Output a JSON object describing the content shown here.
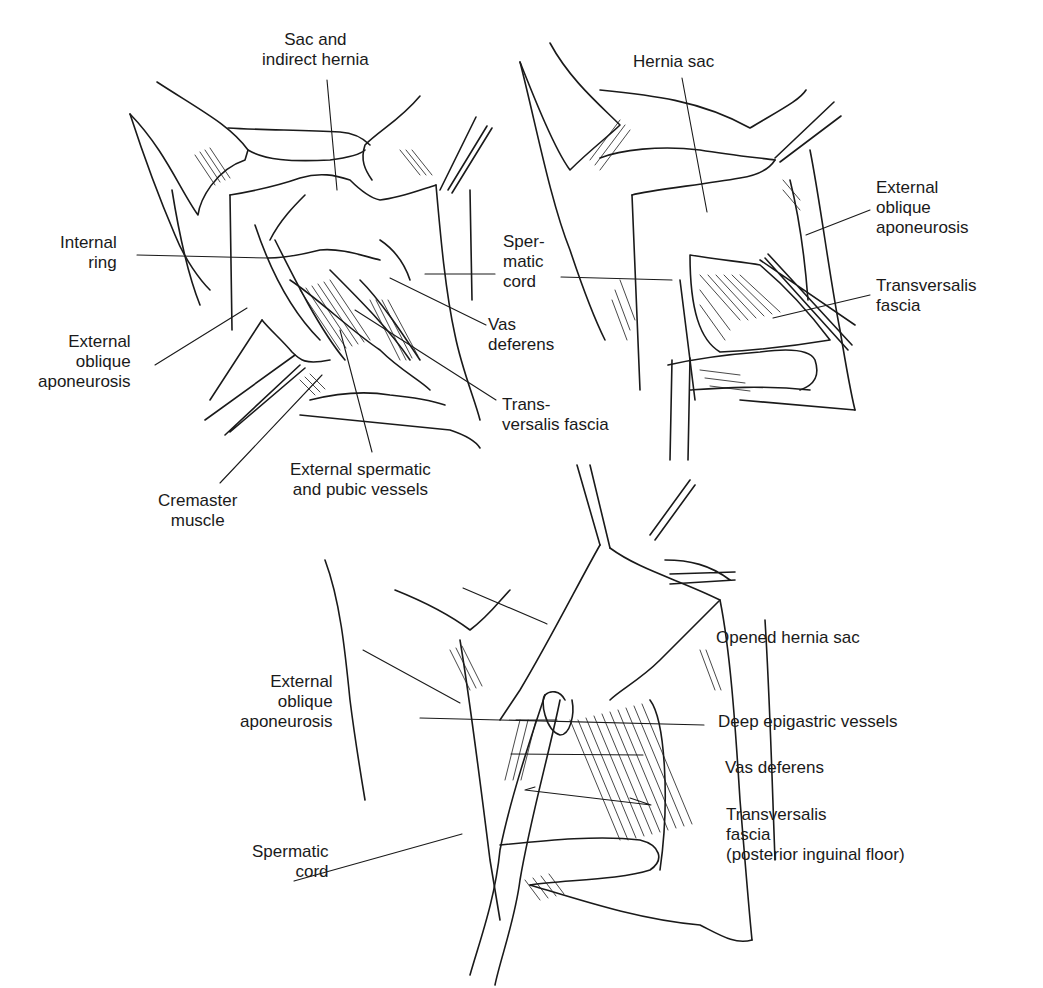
{
  "figure": {
    "panels": [
      {
        "id": "top-left",
        "labels": {
          "sac": "Sac and\nindirect hernia",
          "internal_ring": "Internal\nring",
          "ext_oblique": "External\noblique\naponeurosis",
          "cremaster": "Cremaster\nmuscle",
          "ext_spermatic": "External spermatic\nand pubic vessels",
          "vas": "Vas\ndeferens",
          "transversalis": "Trans-\nversalis fascia",
          "spermatic_cord": "Sper-\nmatic\ncord"
        }
      },
      {
        "id": "top-right",
        "labels": {
          "hernia_sac": "Hernia sac",
          "ext_oblique": "External\noblique\naponeurosis",
          "transversalis": "Transversalis\nfascia"
        }
      },
      {
        "id": "bottom",
        "labels": {
          "opened_sac": "Opened hernia sac",
          "ext_oblique": "External\noblique\naponeurosis",
          "deep_epigastric": "Deep epigastric vessels",
          "vas": "Vas deferens",
          "transversalis": "Transversalis\nfascia\n(posterior inguinal floor)",
          "spermatic_cord": "Spermatic\ncord"
        }
      }
    ]
  },
  "colors": {
    "ink": "#1a1a1a",
    "background": "#ffffff"
  }
}
